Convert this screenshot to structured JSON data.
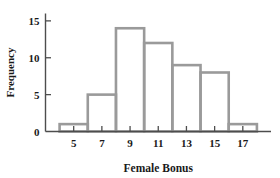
{
  "chart_data": {
    "type": "bar",
    "title": "",
    "xlabel": "Female Bonus",
    "ylabel": "Frequency",
    "categories": [
      "4-6",
      "6-8",
      "8-10",
      "10-12",
      "12-14",
      "14-16",
      "16-18"
    ],
    "bin_edges": [
      4,
      6,
      8,
      10,
      12,
      14,
      16,
      18
    ],
    "values": [
      1,
      5,
      14,
      12,
      9,
      8,
      1
    ],
    "bin_width": 2,
    "xlim": [
      3,
      19
    ],
    "ylim": [
      0,
      16
    ],
    "xticks": [
      5,
      7,
      9,
      11,
      13,
      15,
      17
    ],
    "xtick_labels": [
      "5",
      "7",
      "9",
      "11",
      "13",
      "15",
      "17"
    ],
    "yticks": [
      0,
      5,
      10,
      15
    ],
    "ytick_labels": [
      "0",
      "5",
      "10",
      "15"
    ],
    "grid": false,
    "legend": false,
    "bar_stroke_color": "#9a9a9a",
    "bar_fill_color": "none",
    "axis_color": "#4d4d4d",
    "background_color": "#ffffff"
  }
}
